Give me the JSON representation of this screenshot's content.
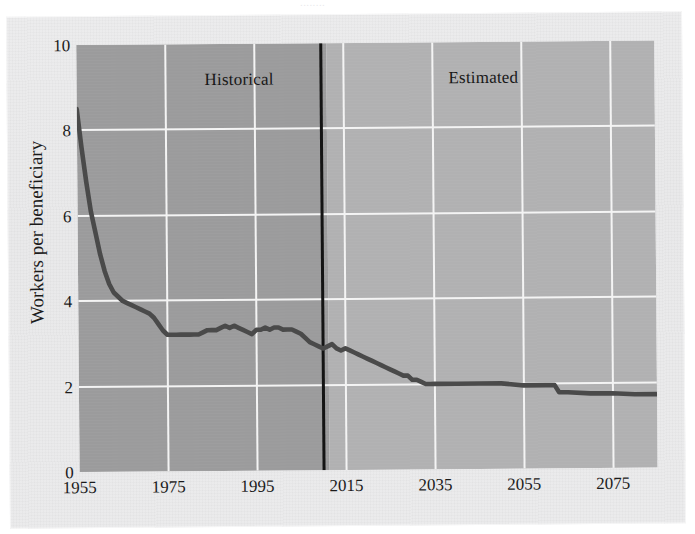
{
  "figure": {
    "clipped_top_text": "........",
    "y_axis_title": "Workers per beneficiary",
    "band_labels": {
      "historical": "Historical",
      "estimated": "Estimated"
    },
    "colors": {
      "paper": "#ebebec",
      "historical_band": "#9b9b9c",
      "estimated_band": "#b1b1b2",
      "gridline": "#f4f4f4",
      "divider": "#141414",
      "series_line": "#4a4a4a",
      "text": "#1b1b1b"
    }
  },
  "chart_data": {
    "type": "line",
    "title": "",
    "xlabel": "",
    "ylabel": "Workers per beneficiary",
    "xlim": [
      1955,
      2085
    ],
    "ylim": [
      0,
      10
    ],
    "xticks": [
      1955,
      1975,
      1995,
      2015,
      2035,
      2055,
      2075
    ],
    "yticks": [
      0,
      2,
      4,
      6,
      8,
      10
    ],
    "grid": true,
    "legend": "none",
    "annotations": [
      {
        "text": "Historical",
        "x": 1984,
        "y": 9.2
      },
      {
        "text": "Estimated",
        "x": 2040,
        "y": 9.2
      },
      {
        "text": "divider",
        "type": "vline",
        "x": 2010
      }
    ],
    "regions": [
      {
        "name": "Historical",
        "x_start": 1955,
        "x_end": 2010,
        "shade": "#9b9b9c"
      },
      {
        "name": "Estimated",
        "x_start": 2010,
        "x_end": 2085,
        "shade": "#b1b1b2"
      }
    ],
    "series": [
      {
        "name": "Workers per beneficiary",
        "color": "#4a4a4a",
        "x": [
          1955,
          1956,
          1957,
          1958,
          1959,
          1960,
          1961,
          1962,
          1963,
          1964,
          1965,
          1966,
          1967,
          1968,
          1969,
          1970,
          1971,
          1972,
          1973,
          1974,
          1975,
          1976,
          1977,
          1978,
          1979,
          1980,
          1981,
          1982,
          1983,
          1984,
          1985,
          1986,
          1987,
          1988,
          1989,
          1990,
          1991,
          1992,
          1993,
          1994,
          1995,
          1996,
          1997,
          1998,
          1999,
          2000,
          2001,
          2002,
          2003,
          2004,
          2005,
          2006,
          2007,
          2008,
          2009,
          2010,
          2011,
          2012,
          2013,
          2014,
          2015,
          2016,
          2017,
          2018,
          2019,
          2020,
          2021,
          2022,
          2023,
          2024,
          2025,
          2026,
          2027,
          2028,
          2029,
          2030,
          2031,
          2032,
          2033,
          2034,
          2035,
          2040,
          2045,
          2050,
          2055,
          2060,
          2062,
          2063,
          2065,
          2070,
          2075,
          2080,
          2085
        ],
        "y": [
          8.5,
          7.6,
          6.8,
          6.1,
          5.6,
          5.1,
          4.7,
          4.4,
          4.2,
          4.1,
          4.0,
          3.95,
          3.9,
          3.85,
          3.8,
          3.75,
          3.7,
          3.6,
          3.45,
          3.3,
          3.2,
          3.2,
          3.2,
          3.2,
          3.2,
          3.2,
          3.2,
          3.2,
          3.25,
          3.3,
          3.3,
          3.3,
          3.35,
          3.4,
          3.35,
          3.4,
          3.35,
          3.3,
          3.25,
          3.2,
          3.3,
          3.3,
          3.35,
          3.3,
          3.35,
          3.35,
          3.3,
          3.3,
          3.3,
          3.25,
          3.2,
          3.1,
          3.0,
          2.95,
          2.9,
          2.85,
          2.9,
          2.95,
          2.85,
          2.8,
          2.85,
          2.8,
          2.75,
          2.7,
          2.65,
          2.6,
          2.55,
          2.5,
          2.45,
          2.4,
          2.35,
          2.3,
          2.25,
          2.2,
          2.2,
          2.1,
          2.1,
          2.05,
          2.0,
          2.0,
          2.0,
          2.0,
          2.0,
          2.0,
          1.95,
          1.95,
          1.95,
          1.78,
          1.78,
          1.75,
          1.75,
          1.72,
          1.72
        ]
      }
    ]
  }
}
